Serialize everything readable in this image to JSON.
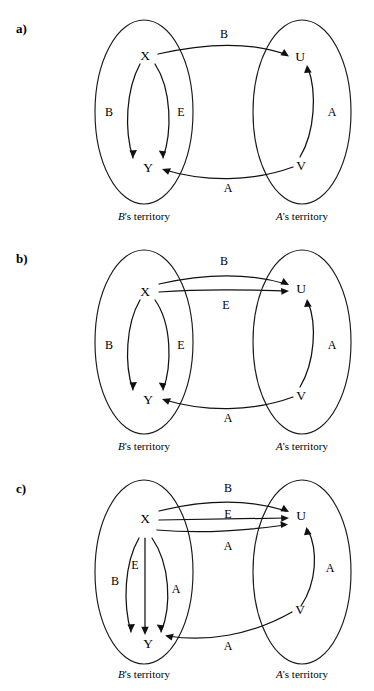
{
  "figure": {
    "background_color": "#ffffff",
    "stroke_color": "#111111",
    "panels": [
      {
        "tag": "a)",
        "left_territory_label_owner": "B",
        "left_territory_label_rest": "'s territory",
        "right_territory_label_owner": "A",
        "right_territory_label_rest": "'s territory",
        "nodes": {
          "top_left": "X",
          "bottom_left": "Y",
          "top_right": "U",
          "bottom_right": "V"
        },
        "edge_labels": {
          "left_outer": "B",
          "left_inner": "E",
          "top_cross": "B",
          "bottom_cross": "A",
          "right_inner": "A"
        }
      },
      {
        "tag": "b)",
        "left_territory_label_owner": "B",
        "left_territory_label_rest": "'s territory",
        "right_territory_label_owner": "A",
        "right_territory_label_rest": "'s territory",
        "nodes": {
          "top_left": "X",
          "bottom_left": "Y",
          "top_right": "U",
          "bottom_right": "V"
        },
        "edge_labels": {
          "left_outer": "B",
          "left_inner": "E",
          "top_cross_upper": "B",
          "top_cross_lower": "E",
          "bottom_cross": "A",
          "right_inner": "A"
        }
      },
      {
        "tag": "c)",
        "left_territory_label_owner": "B",
        "left_territory_label_rest": "'s territory",
        "right_territory_label_owner": "A",
        "right_territory_label_rest": "'s territory",
        "nodes": {
          "top_left": "X",
          "bottom_left": "Y",
          "top_right": "U",
          "bottom_right": "V"
        },
        "edge_labels": {
          "left_outer": "B",
          "left_mid": "E",
          "left_inner": "A",
          "top_cross_upper": "B",
          "top_cross_mid": "E",
          "top_cross_lower": "A",
          "bottom_cross": "A",
          "right_inner": "A"
        }
      }
    ]
  }
}
